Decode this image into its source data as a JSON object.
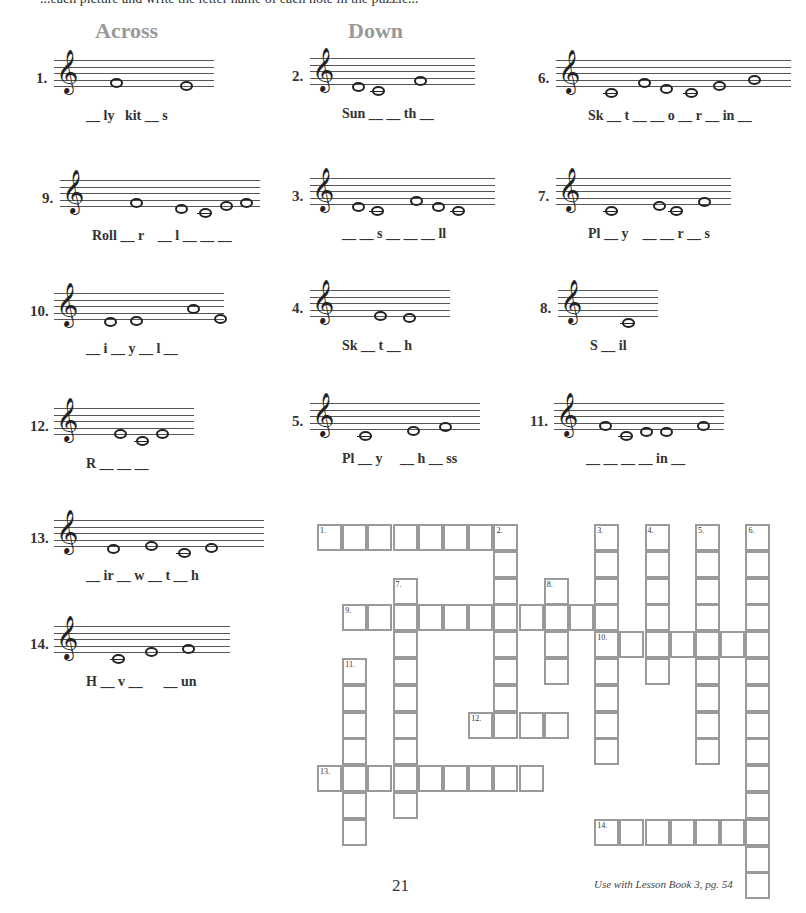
{
  "top_text": "...each picture and write the letter name of each note in the puzzle...",
  "headings": {
    "across": "Across",
    "down": "Down"
  },
  "clues": [
    {
      "num": "1.",
      "word": "__ ly   kit __ s",
      "x": 36,
      "y": 60,
      "staff_width": 160,
      "notes": [
        {
          "dx": 62,
          "pos": 1
        },
        {
          "dx": 132,
          "pos": 0
        }
      ]
    },
    {
      "num": "2.",
      "word": "Sun __ __ th __",
      "x": 292,
      "y": 58,
      "staff_width": 165,
      "notes": [
        {
          "dx": 48,
          "pos": -1
        },
        {
          "dx": 68,
          "pos": -2,
          "ledger": true
        },
        {
          "dx": 110,
          "pos": 1
        }
      ]
    },
    {
      "num": "6.",
      "word": "Sk __ t __ __ o __ r __ in __",
      "x": 538,
      "y": 60,
      "staff_width": 235,
      "notes": [
        {
          "dx": 55,
          "pos": -2,
          "ledger": true
        },
        {
          "dx": 88,
          "pos": 1
        },
        {
          "dx": 110,
          "pos": -1
        },
        {
          "dx": 135,
          "pos": -2,
          "ledger": true
        },
        {
          "dx": 163,
          "pos": 0
        },
        {
          "dx": 198,
          "pos": 2
        }
      ]
    },
    {
      "num": "9.",
      "word": "Roll __ r    __ l __ __ __",
      "x": 42,
      "y": 180,
      "staff_width": 200,
      "notes": [
        {
          "dx": 76,
          "pos": 1
        },
        {
          "dx": 121,
          "pos": -1
        },
        {
          "dx": 145,
          "pos": -2,
          "ledger": true
        },
        {
          "dx": 166,
          "pos": 0
        },
        {
          "dx": 186,
          "pos": 1
        }
      ]
    },
    {
      "num": "3.",
      "word": "__ __ s __ __ __ ll",
      "x": 292,
      "y": 178,
      "staff_width": 185,
      "notes": [
        {
          "dx": 48,
          "pos": -1
        },
        {
          "dx": 67,
          "pos": -2,
          "ledger": true
        },
        {
          "dx": 106,
          "pos": 1
        },
        {
          "dx": 128,
          "pos": -1
        },
        {
          "dx": 148,
          "pos": -2,
          "ledger": true
        }
      ]
    },
    {
      "num": "7.",
      "word": "Pl __ y    __ __ r __ s",
      "x": 538,
      "y": 178,
      "staff_width": 175,
      "notes": [
        {
          "dx": 55,
          "pos": -2,
          "ledger": true
        },
        {
          "dx": 103,
          "pos": -0.5
        },
        {
          "dx": 120,
          "pos": -2,
          "ledger": true
        },
        {
          "dx": 148,
          "pos": 0.5
        }
      ]
    },
    {
      "num": "10.",
      "word": "__ i __ y __ l __",
      "x": 30,
      "y": 293,
      "staff_width": 170,
      "notes": [
        {
          "dx": 62,
          "pos": -1
        },
        {
          "dx": 88,
          "pos": -0.5
        },
        {
          "dx": 145,
          "pos": 3
        },
        {
          "dx": 142,
          "pos": 0,
          "shift": 30
        }
      ]
    },
    {
      "num": "4.",
      "word": "Sk __ t __ h",
      "x": 292,
      "y": 290,
      "staff_width": 140,
      "notes": [
        {
          "dx": 70,
          "pos": 0
        },
        {
          "dx": 99,
          "pos": -0.5
        }
      ]
    },
    {
      "num": "8.",
      "word": "S __ il",
      "x": 540,
      "y": 290,
      "staff_width": 100,
      "notes": [
        {
          "dx": 70,
          "pos": -2,
          "ledger": true
        }
      ]
    },
    {
      "num": "12.",
      "word": "R __ __ __",
      "x": 30,
      "y": 408,
      "staff_width": 140,
      "notes": [
        {
          "dx": 72,
          "pos": 0
        },
        {
          "dx": 94,
          "pos": -2,
          "ledger": true
        },
        {
          "dx": 114,
          "pos": 0
        }
      ]
    },
    {
      "num": "5.",
      "word": "Pl __ y     __ h __ ss",
      "x": 292,
      "y": 403,
      "staff_width": 170,
      "notes": [
        {
          "dx": 55,
          "pos": -2,
          "ledger": true
        },
        {
          "dx": 103,
          "pos": -0.5
        },
        {
          "dx": 135,
          "pos": 0.5
        }
      ]
    },
    {
      "num": "11.",
      "word": "__ __ __ __ in __",
      "x": 530,
      "y": 403,
      "staff_width": 170,
      "notes": [
        {
          "dx": 57,
          "pos": 1
        },
        {
          "dx": 78,
          "pos": -2,
          "ledger": true
        },
        {
          "dx": 98,
          "pos": -1
        },
        {
          "dx": 118,
          "pos": -1
        },
        {
          "dx": 155,
          "pos": 1
        }
      ]
    },
    {
      "num": "13.",
      "word": "__ ir __ w __ t __ h",
      "x": 30,
      "y": 520,
      "staff_width": 210,
      "notes": [
        {
          "dx": 65,
          "pos": -1
        },
        {
          "dx": 103,
          "pos": 0
        },
        {
          "dx": 136,
          "pos": -2,
          "ledger": true
        },
        {
          "dx": 163,
          "pos": -0.5
        }
      ]
    },
    {
      "num": "14.",
      "word": "H __ v __      __ un",
      "x": 30,
      "y": 626,
      "staff_width": 176,
      "notes": [
        {
          "dx": 70,
          "pos": -2,
          "ledger": true
        },
        {
          "dx": 103,
          "pos": 0
        },
        {
          "dx": 140,
          "pos": 1
        }
      ]
    }
  ],
  "crossword": {
    "origin_x": 317,
    "origin_y": 524,
    "cell_w": 25.2,
    "cell_h": 26.8,
    "words": [
      {
        "num": "1.",
        "dir": "across",
        "row": 0,
        "col": 0,
        "len": 8
      },
      {
        "num": "2.",
        "dir": "down",
        "row": 0,
        "col": 7,
        "len": 8
      },
      {
        "num": "3.",
        "dir": "down",
        "row": 0,
        "col": 11,
        "len": 9
      },
      {
        "num": "4.",
        "dir": "down",
        "row": 0,
        "col": 13,
        "len": 6
      },
      {
        "num": "5.",
        "dir": "down",
        "row": 0,
        "col": 15,
        "len": 9
      },
      {
        "num": "6.",
        "dir": "down",
        "row": 0,
        "col": 17,
        "len": 14
      },
      {
        "num": "7.",
        "dir": "down",
        "row": 2,
        "col": 3,
        "len": 9
      },
      {
        "num": "8.",
        "dir": "down",
        "row": 2,
        "col": 9,
        "len": 4
      },
      {
        "num": "9.",
        "dir": "across",
        "row": 3,
        "col": 1,
        "len": 11
      },
      {
        "num": "10.",
        "dir": "across",
        "row": 4,
        "col": 11,
        "len": 7
      },
      {
        "num": "11.",
        "dir": "down",
        "row": 5,
        "col": 1,
        "len": 7
      },
      {
        "num": "12.",
        "dir": "across",
        "row": 7,
        "col": 6,
        "len": 4
      },
      {
        "num": "13.",
        "dir": "across",
        "row": 9,
        "col": 0,
        "len": 9
      },
      {
        "num": "14.",
        "dir": "across",
        "row": 11,
        "col": 11,
        "len": 7
      }
    ]
  },
  "page_number": "21",
  "footer": "Use with Lesson Book 3, pg. 54"
}
